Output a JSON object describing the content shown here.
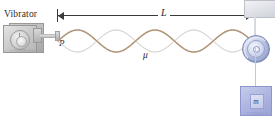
{
  "diagram": {
    "background_color": "#ffffff"
  },
  "labels": {
    "vibrator": "Vibrator",
    "point_p": "P",
    "length_l": "L",
    "linear_density_mu": "μ",
    "mass_m": "m"
  },
  "colors": {
    "wave": "#b29476",
    "wave_envelope": "#e9eef7",
    "pulley": "#9aa6cf",
    "mass_block": "#aeb5e0",
    "vibrator_body": "#cfcfcf",
    "dimension_line": "#3a3a3a",
    "support_block": "#e2e4ea"
  },
  "wave": {
    "loops": 5,
    "nodes": 6,
    "antinodes": 5,
    "start_x": 58,
    "end_x": 252,
    "axis_y": 41,
    "amplitude": 11
  },
  "icons": {
    "vibrator": "vibrator-device-icon",
    "pulley": "pulley-wheel-icon",
    "mass": "hanging-mass-icon",
    "support": "ceiling-support-icon",
    "arrow_left": "arrow-left-icon",
    "arrow_right": "arrow-right-icon"
  }
}
